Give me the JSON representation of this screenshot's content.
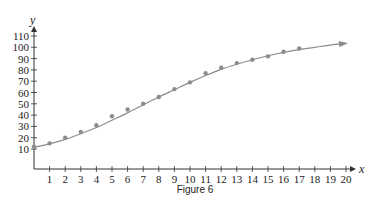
{
  "chart_data": {
    "type": "scatter",
    "title": "",
    "caption": "Figure 6",
    "xlabel": "x",
    "ylabel": "y",
    "xlim": [
      0,
      20
    ],
    "ylim": [
      0,
      115
    ],
    "x_ticks": [
      1,
      2,
      3,
      4,
      5,
      6,
      7,
      8,
      9,
      10,
      11,
      12,
      13,
      14,
      15,
      16,
      17,
      18,
      19,
      20
    ],
    "y_ticks": [
      10,
      20,
      30,
      40,
      50,
      60,
      70,
      80,
      90,
      100,
      110
    ],
    "grid": false,
    "legend": null,
    "series": [
      {
        "name": "data points",
        "kind": "scatter",
        "color": "#8c8c8c",
        "x": [
          0,
          1,
          2,
          3,
          4,
          5,
          6,
          7,
          8,
          9,
          10,
          11,
          12,
          13,
          14,
          15,
          16,
          17
        ],
        "y": [
          12,
          15,
          20,
          25,
          31,
          39,
          45,
          50,
          56,
          63,
          69,
          77,
          82,
          86,
          89,
          92,
          96,
          99
        ]
      },
      {
        "name": "logistic fit curve",
        "kind": "line",
        "color": "#8c8c8c",
        "arrow_end": true,
        "x": [
          0,
          1,
          2,
          3,
          4,
          5,
          6,
          7,
          8,
          9,
          10,
          11,
          12,
          13,
          14,
          15,
          16,
          17,
          18,
          19,
          20
        ],
        "y": [
          11.5,
          14.5,
          18.5,
          23.5,
          29,
          35.5,
          42,
          49,
          56,
          62.5,
          69,
          75,
          80.5,
          85,
          89,
          92.5,
          95.5,
          98,
          100,
          102,
          103.5
        ]
      }
    ]
  }
}
